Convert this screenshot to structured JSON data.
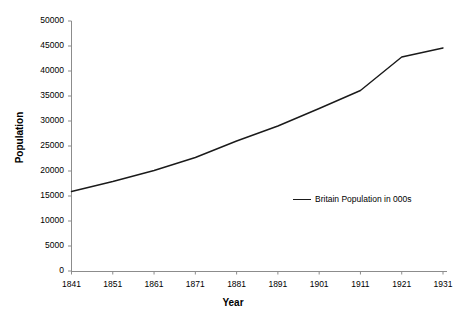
{
  "chart_data": {
    "type": "line",
    "title": "",
    "xlabel": "Year",
    "ylabel": "Population",
    "x": [
      1841,
      1851,
      1861,
      1871,
      1881,
      1891,
      1901,
      1911,
      1921,
      1931
    ],
    "xtick_labels": [
      "1841",
      "1851",
      "1861",
      "1871",
      "1881",
      "1891",
      "1901",
      "1911",
      "1921",
      "1931"
    ],
    "ytick_labels": [
      "0",
      "5000",
      "10000",
      "15000",
      "20000",
      "25000",
      "30000",
      "35000",
      "40000",
      "45000",
      "50000"
    ],
    "ytick_values": [
      0,
      5000,
      10000,
      15000,
      20000,
      25000,
      30000,
      35000,
      40000,
      45000,
      50000
    ],
    "ylim": [
      0,
      50000
    ],
    "xlim": [
      1841,
      1931
    ],
    "grid": false,
    "legend_position": "inside-center-right",
    "series": [
      {
        "name": "Britain Population in 000s",
        "color": "#1a1a1a",
        "values": [
          15900,
          17900,
          20100,
          22700,
          26000,
          29000,
          32500,
          36100,
          42800,
          44600
        ]
      }
    ]
  },
  "axis": {
    "x_title": "Year",
    "y_title": "Population"
  },
  "legend": {
    "entries": [
      {
        "label": "Britain Population in 000s"
      }
    ]
  },
  "colors": {
    "line": "#1a1a1a",
    "axis": "#808080",
    "text": "#000000",
    "background": "#ffffff"
  }
}
